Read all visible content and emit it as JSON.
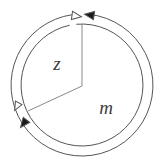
{
  "figure": {
    "name": "concentric-circular-arrows-diagram",
    "width": 163,
    "height": 168,
    "background_color": "#ffffff",
    "stroke_color": "#555555",
    "label_color": "#3c3c3c",
    "stroke_width": 1
  },
  "labels": {
    "inner_region": "z",
    "outer_region": "m"
  },
  "label_positions": {
    "inner_region": {
      "x": 57,
      "y": 70,
      "font_size": 19
    },
    "outer_region": {
      "x": 106,
      "y": 114,
      "font_size": 19
    }
  },
  "geometry": {
    "center": {
      "x": 82,
      "y": 85
    },
    "outer_circle_radius": 71,
    "inner_circle_radius": 61,
    "wedge_vertex": {
      "x": 82,
      "y": 86
    },
    "wedge_radius_up_end": {
      "x": 82,
      "y": 24
    },
    "wedge_radius_downleft_end": {
      "x": 28,
      "y": 111
    }
  },
  "arcs": [
    {
      "id": "outer-arc",
      "name": "outer-circular-arrow-arc",
      "radius": 71,
      "start_angle_deg": -84,
      "end_angle_deg": 262,
      "direction": "clockwise-gap-at-top"
    },
    {
      "id": "inner-arc",
      "name": "inner-circular-arrow-arc",
      "radius": 61,
      "start_angle_deg": -95,
      "end_angle_deg": 258,
      "direction": "counterclockwise-gap-at-top"
    }
  ],
  "arrowheads": [
    {
      "id": "top-hollow-arrowhead",
      "name": "hollow-arrowhead-top",
      "style": "hollow",
      "position": {
        "x": 76,
        "y": 16
      },
      "rotation_deg": 8,
      "points_direction": "right",
      "size": 9
    },
    {
      "id": "top-filled-arrowhead",
      "name": "filled-arrowhead-top",
      "style": "filled",
      "position": {
        "x": 90,
        "y": 15
      },
      "rotation_deg": 188,
      "points_direction": "left",
      "size": 9
    },
    {
      "id": "left-hollow-arrowhead",
      "name": "hollow-arrowhead-left",
      "style": "hollow",
      "position": {
        "x": 17,
        "y": 106
      },
      "rotation_deg": 118,
      "points_direction": "down-left",
      "size": 8
    },
    {
      "id": "left-filled-arrowhead",
      "name": "filled-arrowhead-lower-left",
      "style": "filled",
      "position": {
        "x": 24,
        "y": 123
      },
      "rotation_deg": 128,
      "points_direction": "down-left",
      "size": 9
    }
  ]
}
